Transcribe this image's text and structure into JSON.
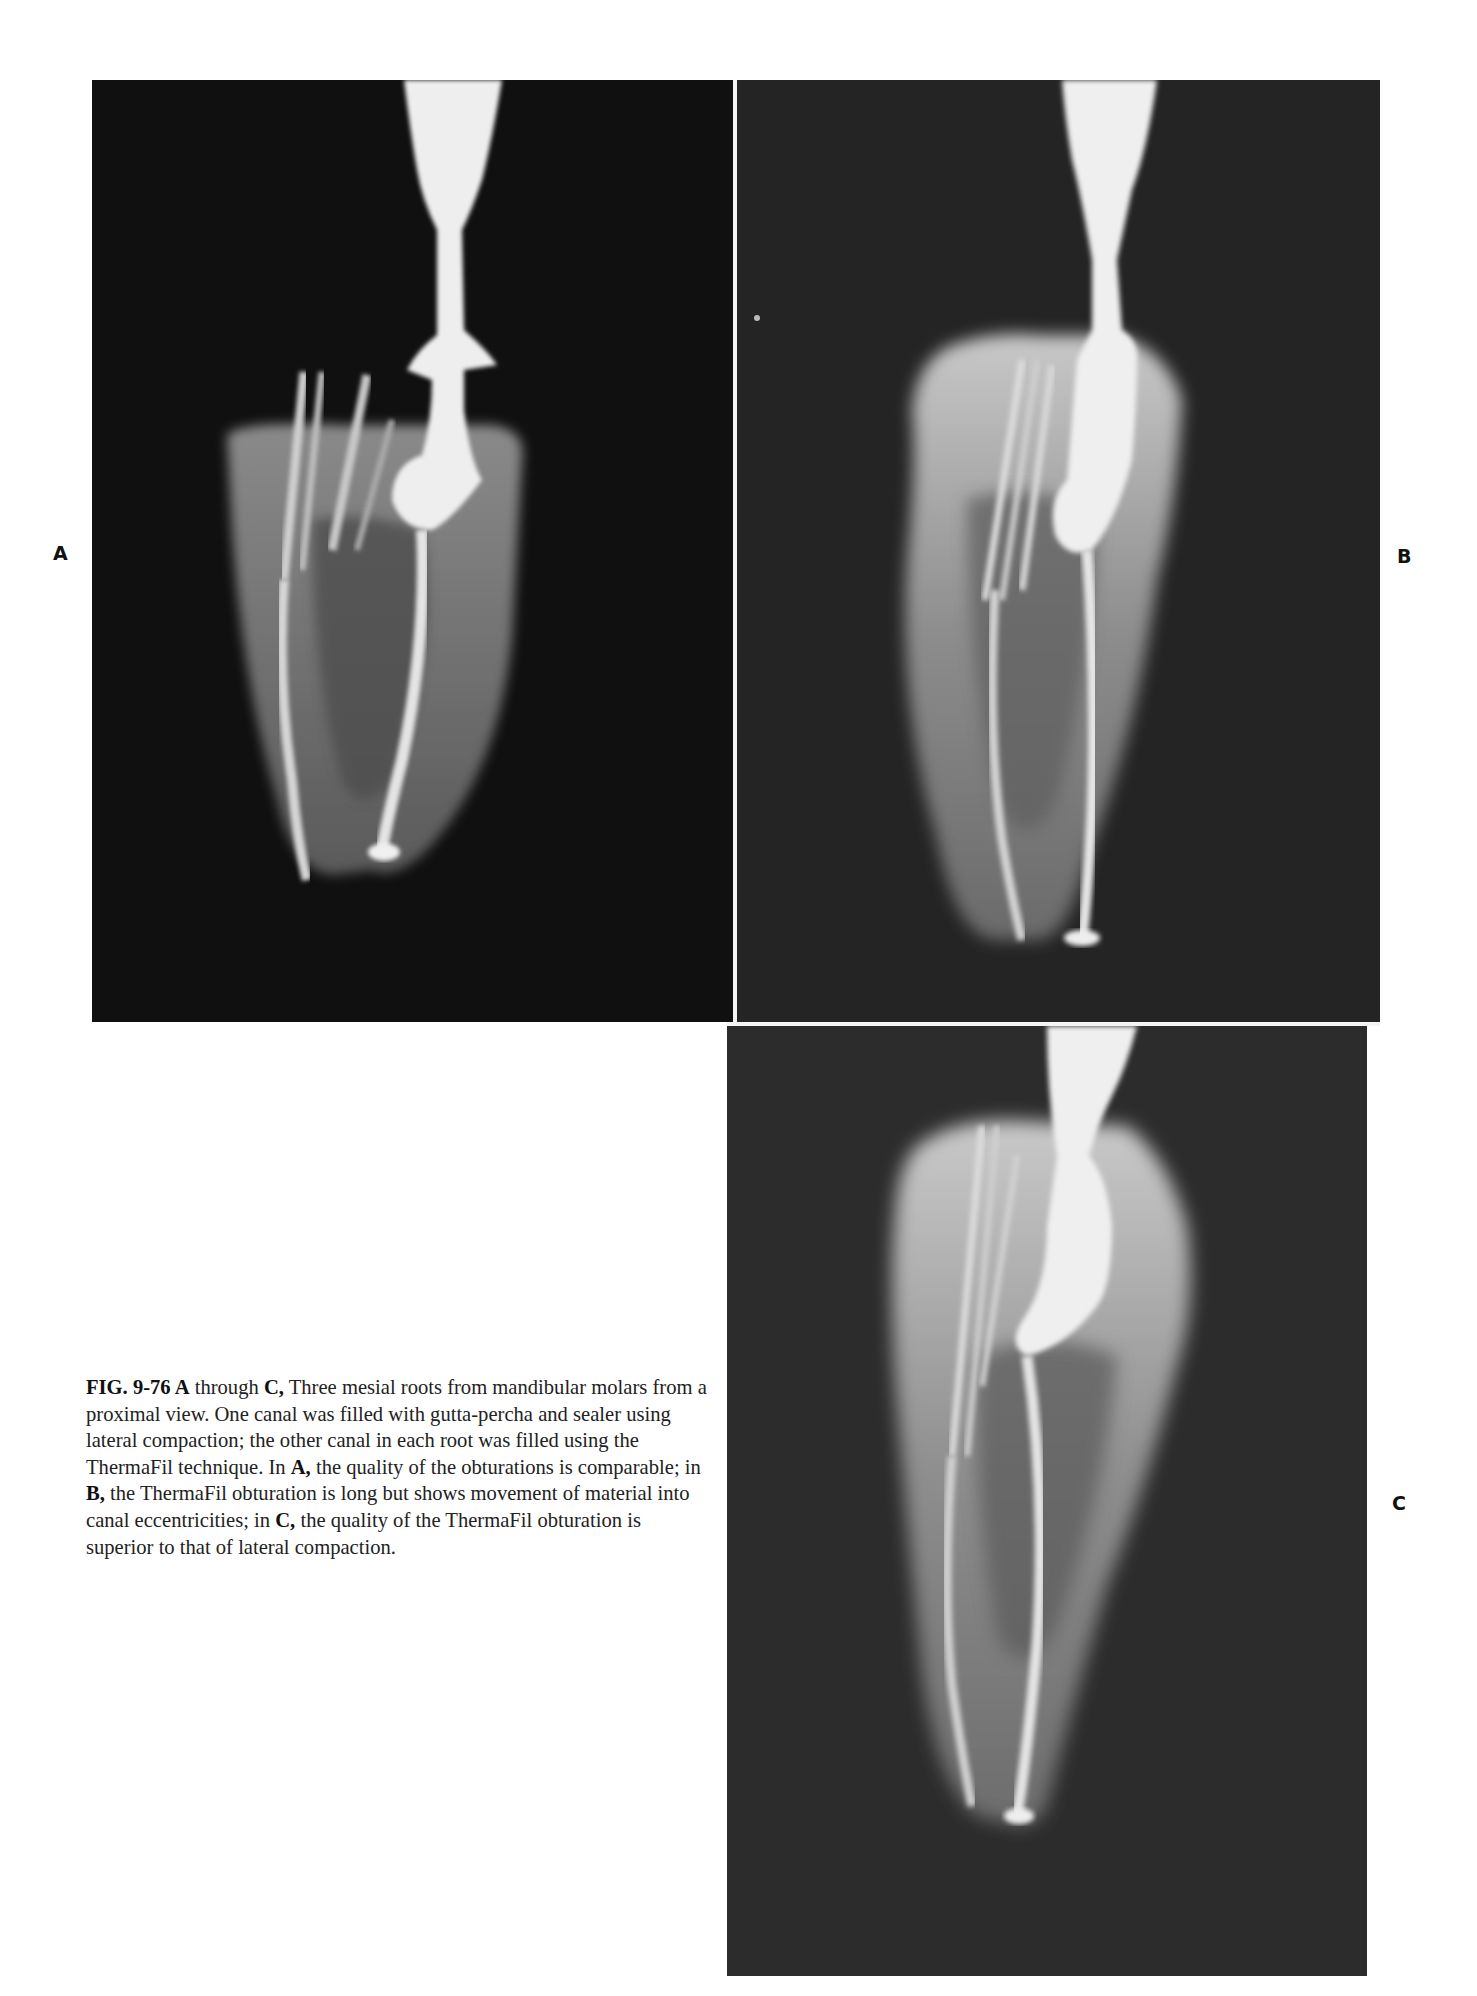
{
  "figure": {
    "number": "FIG. 9-76",
    "panels": [
      {
        "id": "A",
        "label": "A",
        "description": "Radiograph of mesial root from mandibular molar, proximal view; lateral compaction and ThermaFil obturations comparable"
      },
      {
        "id": "B",
        "label": "B",
        "description": "Radiograph of mesial root; ThermaFil obturation long with material movement into canal eccentricities"
      },
      {
        "id": "C",
        "label": "C",
        "description": "Radiograph of mesial root; ThermaFil obturation superior to lateral compaction"
      }
    ],
    "caption": {
      "segments": [
        {
          "text": "FIG. 9-76 ",
          "bold": true
        },
        {
          "text": "A",
          "bold": true
        },
        {
          "text": " through ",
          "bold": false
        },
        {
          "text": "C,",
          "bold": true
        },
        {
          "text": " Three mesial roots from mandibular molars from a proximal view. One canal was filled with gutta-percha and sealer using lateral compaction; the other canal in each root was filled using the ThermaFil technique. In ",
          "bold": false
        },
        {
          "text": "A,",
          "bold": true
        },
        {
          "text": " the quality of the obturations is comparable; in ",
          "bold": false
        },
        {
          "text": "B,",
          "bold": true
        },
        {
          "text": " the ThermaFil obturation is long but shows movement of material into canal eccentricities; in ",
          "bold": false
        },
        {
          "text": "C,",
          "bold": true
        },
        {
          "text": " the quality of the ThermaFil obturation is superior to that of lateral compaction.",
          "bold": false
        }
      ]
    }
  },
  "colors": {
    "page_background": "#ffffff",
    "panel_a_background": "#0f0f0f",
    "panel_b_background": "#222222",
    "panel_c_background": "#2b2b2b",
    "radiopaque": "#f2f2f2",
    "tooth": "#9a9a9a",
    "caption_text": "#222222"
  }
}
